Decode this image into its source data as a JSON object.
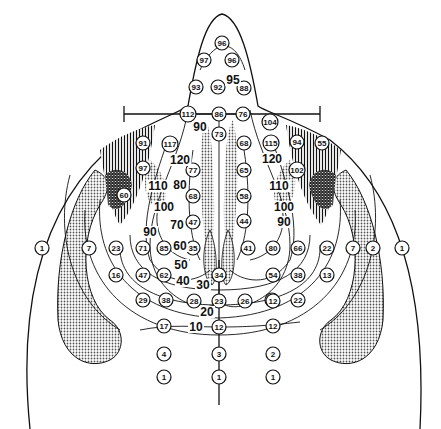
{
  "figure": {
    "type": "isodose contour diagram of head/neck and upper torso (posterior view)",
    "colors": {
      "ink": "#111111",
      "stipple": "#9a9a9a",
      "background": "#ffffff"
    }
  },
  "circled_labels": [
    {
      "id": "c96a",
      "v": "96",
      "x": 222,
      "y": 43
    },
    {
      "id": "c97",
      "v": "97",
      "x": 204,
      "y": 60
    },
    {
      "id": "c96b",
      "v": "96",
      "x": 232,
      "y": 60
    },
    {
      "id": "c93",
      "v": "93",
      "x": 196,
      "y": 87
    },
    {
      "id": "c92",
      "v": "92",
      "x": 218,
      "y": 87
    },
    {
      "id": "c88",
      "v": "88",
      "x": 244,
      "y": 88
    },
    {
      "id": "c112",
      "v": "112",
      "x": 188,
      "y": 114
    },
    {
      "id": "c86",
      "v": "86",
      "x": 219,
      "y": 114
    },
    {
      "id": "c76",
      "v": "76",
      "x": 243,
      "y": 114
    },
    {
      "id": "c104",
      "v": "104",
      "x": 270,
      "y": 122
    },
    {
      "id": "c91",
      "v": "91",
      "x": 143,
      "y": 143
    },
    {
      "id": "c117",
      "v": "117",
      "x": 170,
      "y": 144
    },
    {
      "id": "c73",
      "v": "73",
      "x": 219,
      "y": 134
    },
    {
      "id": "c68a",
      "v": "68",
      "x": 244,
      "y": 143
    },
    {
      "id": "c115",
      "v": "115",
      "x": 271,
      "y": 143
    },
    {
      "id": "c94",
      "v": "94",
      "x": 297,
      "y": 142
    },
    {
      "id": "c55",
      "v": "55",
      "x": 322,
      "y": 143
    },
    {
      "id": "c97b",
      "v": "97",
      "x": 143,
      "y": 168
    },
    {
      "id": "c102",
      "v": "102",
      "x": 297,
      "y": 170
    },
    {
      "id": "c77",
      "v": "77",
      "x": 193,
      "y": 170
    },
    {
      "id": "c65",
      "v": "65",
      "x": 244,
      "y": 170
    },
    {
      "id": "c60",
      "v": "60",
      "x": 124,
      "y": 195
    },
    {
      "id": "c68b",
      "v": "68",
      "x": 193,
      "y": 196
    },
    {
      "id": "c58",
      "v": "58",
      "x": 244,
      "y": 196
    },
    {
      "id": "c47a",
      "v": "47",
      "x": 193,
      "y": 222
    },
    {
      "id": "c44",
      "v": "44",
      "x": 244,
      "y": 221
    },
    {
      "id": "c7a",
      "v": "7",
      "x": 89,
      "y": 248
    },
    {
      "id": "c23",
      "v": "23",
      "x": 116,
      "y": 248
    },
    {
      "id": "c71",
      "v": "71",
      "x": 143,
      "y": 248
    },
    {
      "id": "c85",
      "v": "85",
      "x": 164,
      "y": 248
    },
    {
      "id": "c35",
      "v": "35",
      "x": 193,
      "y": 248
    },
    {
      "id": "c41",
      "v": "41",
      "x": 248,
      "y": 248
    },
    {
      "id": "c80",
      "v": "80",
      "x": 273,
      "y": 248
    },
    {
      "id": "c66",
      "v": "66",
      "x": 298,
      "y": 248
    },
    {
      "id": "c22a",
      "v": "22",
      "x": 327,
      "y": 248
    },
    {
      "id": "c7b",
      "v": "7",
      "x": 353,
      "y": 248
    },
    {
      "id": "c2a",
      "v": "2",
      "x": 373,
      "y": 248
    },
    {
      "id": "c1a",
      "v": "1",
      "x": 402,
      "y": 248
    },
    {
      "id": "c1b",
      "v": "1",
      "x": 42,
      "y": 248
    },
    {
      "id": "c16",
      "v": "16",
      "x": 116,
      "y": 275
    },
    {
      "id": "c47b",
      "v": "47",
      "x": 143,
      "y": 275
    },
    {
      "id": "c62",
      "v": "62",
      "x": 164,
      "y": 275
    },
    {
      "id": "c54",
      "v": "54",
      "x": 273,
      "y": 275
    },
    {
      "id": "c38a",
      "v": "38",
      "x": 298,
      "y": 275
    },
    {
      "id": "c13",
      "v": "13",
      "x": 327,
      "y": 275
    },
    {
      "id": "c34",
      "v": "34",
      "x": 219,
      "y": 275
    },
    {
      "id": "c29",
      "v": "29",
      "x": 143,
      "y": 300
    },
    {
      "id": "c38b",
      "v": "38",
      "x": 166,
      "y": 300
    },
    {
      "id": "c28",
      "v": "28",
      "x": 194,
      "y": 301
    },
    {
      "id": "c23b",
      "v": "23",
      "x": 219,
      "y": 301
    },
    {
      "id": "c26",
      "v": "26",
      "x": 245,
      "y": 301
    },
    {
      "id": "c31",
      "v": "31",
      "x": 272,
      "y": 300
    },
    {
      "id": "c22b",
      "v": "22",
      "x": 298,
      "y": 300
    },
    {
      "id": "c17",
      "v": "17",
      "x": 164,
      "y": 326
    },
    {
      "id": "c12a",
      "v": "12",
      "x": 219,
      "y": 327
    },
    {
      "id": "c12b",
      "v": "12",
      "x": 273,
      "y": 326
    },
    {
      "id": "c12c",
      "v": "12",
      "x": 273,
      "y": 301
    },
    {
      "id": "c4",
      "v": "4",
      "x": 164,
      "y": 354
    },
    {
      "id": "c3",
      "v": "3",
      "x": 219,
      "y": 354
    },
    {
      "id": "c2b",
      "v": "2",
      "x": 273,
      "y": 354
    },
    {
      "id": "c1c",
      "v": "1",
      "x": 164,
      "y": 377
    },
    {
      "id": "c1d",
      "v": "1",
      "x": 219,
      "y": 377
    },
    {
      "id": "c1e",
      "v": "1",
      "x": 273,
      "y": 377
    }
  ],
  "isodose_labels": [
    {
      "id": "i95",
      "v": "95",
      "x": 233,
      "y": 80
    },
    {
      "id": "i90a",
      "v": "90",
      "x": 200,
      "y": 127
    },
    {
      "id": "i120a",
      "v": "120",
      "x": 180,
      "y": 160
    },
    {
      "id": "i80a",
      "v": "80",
      "x": 180,
      "y": 185
    },
    {
      "id": "i110a",
      "v": "110",
      "x": 158,
      "y": 186
    },
    {
      "id": "i100a",
      "v": "100",
      "x": 164,
      "y": 207
    },
    {
      "id": "i70",
      "v": "70",
      "x": 177,
      "y": 225
    },
    {
      "id": "i90b",
      "v": "90",
      "x": 150,
      "y": 232
    },
    {
      "id": "i60",
      "v": "60",
      "x": 180,
      "y": 246
    },
    {
      "id": "i50",
      "v": "50",
      "x": 181,
      "y": 265
    },
    {
      "id": "i40",
      "v": "40",
      "x": 183,
      "y": 281
    },
    {
      "id": "i30",
      "v": "30",
      "x": 203,
      "y": 285
    },
    {
      "id": "i20",
      "v": "20",
      "x": 207,
      "y": 312
    },
    {
      "id": "i10",
      "v": "10",
      "x": 196,
      "y": 327
    },
    {
      "id": "i120b",
      "v": "120",
      "x": 272,
      "y": 159
    },
    {
      "id": "i110b",
      "v": "110",
      "x": 279,
      "y": 186
    },
    {
      "id": "i100b",
      "v": "100",
      "x": 284,
      "y": 207
    },
    {
      "id": "i90c",
      "v": "90",
      "x": 284,
      "y": 222
    }
  ]
}
